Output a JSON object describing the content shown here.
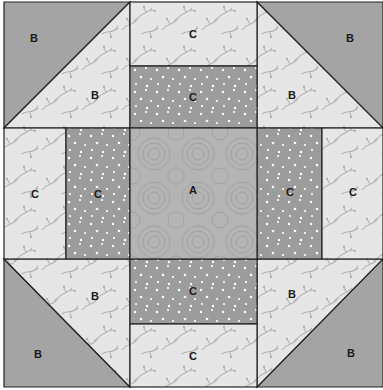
{
  "diagram": {
    "colors": {
      "solid_dark": "#a4a4a4",
      "dotted_dark": "#9c9c9c",
      "dots": "#ffffff",
      "leafy_light": "#e6e6e6",
      "leafy_vine": "#b8b8b8",
      "center_swirl": "#b4b4b4",
      "swirl_lines": "#9a9a9a",
      "seam": "#222222"
    },
    "pieces": {
      "corner_tl_outer": "B",
      "corner_tl_inner": "B",
      "corner_tr_outer": "B",
      "corner_tr_inner": "B",
      "corner_bl_outer": "B",
      "corner_bl_inner": "B",
      "corner_br_outer": "B",
      "corner_br_inner": "B",
      "top_outer": "C",
      "top_inner": "C",
      "bottom_outer": "C",
      "bottom_inner": "C",
      "left_outer": "C",
      "left_inner": "C",
      "right_outer": "C",
      "right_inner": "C",
      "center": "A"
    }
  }
}
